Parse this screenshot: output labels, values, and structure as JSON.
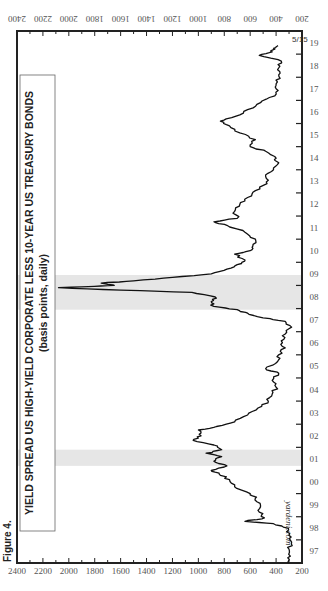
{
  "figure_label": "Figure 4.",
  "title_line1": "YIELD SPREAD US HIGH-YIELD CORPORATE LESS 10-YEAR US TREASURY BONDS",
  "title_line2": "(basis points, daily)",
  "watermark": "yardeni.com",
  "end_annotation": "5/15",
  "colors": {
    "line": "#111111",
    "recession": "#e6e6e6",
    "axis": "#222222",
    "text": "#555555"
  },
  "chart_data": {
    "type": "line",
    "title": "YIELD SPREAD US HIGH-YIELD CORPORATE LESS 10-YEAR US TREASURY BONDS",
    "subtitle": "(basis points, daily)",
    "xlabel": "",
    "ylabel": "basis points",
    "orientation": "rotated 90 degrees counterclockwise",
    "xlim": [
      1997,
      2020
    ],
    "ylim": [
      200,
      2400
    ],
    "x_tick_labels": [
      "97",
      "98",
      "99",
      "00",
      "01",
      "02",
      "03",
      "04",
      "05",
      "06",
      "07",
      "08",
      "09",
      "10",
      "11",
      "12",
      "13",
      "14",
      "15",
      "16",
      "17",
      "18",
      "19",
      "20"
    ],
    "y_tick_labels": [
      "200",
      "400",
      "600",
      "800",
      "1000",
      "1200",
      "1400",
      "1600",
      "1800",
      "2000",
      "2200",
      "2400"
    ],
    "y_ticks_both_sides": true,
    "grid": false,
    "legend": null,
    "recession_shading": [
      {
        "start": 2001.2,
        "end": 2001.9
      },
      {
        "start": 2007.95,
        "end": 2009.45
      }
    ],
    "annotation": {
      "text": "5/15",
      "x": 2019.37,
      "y": 385
    },
    "series": [
      {
        "name": "HY corporate less 10-yr Treasury spread",
        "x": [
          1997.0,
          1997.3,
          1997.6,
          1997.9,
          1998.2,
          1998.5,
          1998.7,
          1998.8,
          1998.95,
          1999.2,
          1999.5,
          1999.8,
          2000.0,
          2000.3,
          2000.6,
          2000.85,
          2001.0,
          2001.2,
          2001.4,
          2001.6,
          2001.75,
          2001.9,
          2002.1,
          2002.3,
          2002.5,
          2002.75,
          2002.9,
          2003.1,
          2003.4,
          2003.7,
          2004.0,
          2004.3,
          2004.6,
          2004.9,
          2005.2,
          2005.4,
          2005.7,
          2006.0,
          2006.3,
          2006.6,
          2006.9,
          2007.2,
          2007.45,
          2007.6,
          2007.8,
          2007.95,
          2008.1,
          2008.3,
          2008.5,
          2008.7,
          2008.8,
          2008.9,
          2008.95,
          2009.0,
          2009.1,
          2009.2,
          2009.35,
          2009.5,
          2009.7,
          2009.9,
          2010.1,
          2010.35,
          2010.5,
          2010.7,
          2011.0,
          2011.3,
          2011.6,
          2011.75,
          2011.9,
          2012.2,
          2012.5,
          2012.8,
          2013.1,
          2013.4,
          2013.7,
          2014.0,
          2014.3,
          2014.5,
          2014.8,
          2015.0,
          2015.3,
          2015.6,
          2015.9,
          2016.1,
          2016.3,
          2016.6,
          2016.9,
          2017.2,
          2017.5,
          2017.8,
          2018.1,
          2018.4,
          2018.7,
          2018.95,
          2019.1,
          2019.25,
          2019.37
        ],
        "values": [
          310,
          290,
          300,
          280,
          300,
          305,
          420,
          640,
          490,
          530,
          520,
          560,
          600,
          720,
          760,
          840,
          900,
          780,
          880,
          820,
          940,
          820,
          880,
          1040,
          980,
          1000,
          860,
          720,
          620,
          540,
          460,
          430,
          400,
          430,
          380,
          480,
          390,
          380,
          330,
          360,
          330,
          280,
          330,
          500,
          620,
          700,
          880,
          900,
          870,
          1050,
          1600,
          2080,
          1850,
          1650,
          1750,
          1500,
          1200,
          900,
          780,
          700,
          640,
          720,
          600,
          580,
          560,
          640,
          780,
          880,
          700,
          720,
          680,
          620,
          560,
          470,
          480,
          420,
          380,
          400,
          480,
          600,
          560,
          680,
          760,
          830,
          720,
          620,
          520,
          410,
          400,
          390,
          380,
          380,
          360,
          530,
          430,
          420,
          385
        ]
      }
    ]
  },
  "axes": {
    "left_value_labels": [
      "2400",
      "2200",
      "2000",
      "1800",
      "1600",
      "1400",
      "1200",
      "1000",
      "800",
      "600",
      "400",
      "200"
    ],
    "right_value_labels": [
      "2400",
      "2200",
      "2000",
      "1800",
      "1600",
      "1400",
      "1200",
      "1000",
      "800",
      "600",
      "400",
      "200"
    ],
    "year_labels": [
      "97",
      "98",
      "99",
      "00",
      "01",
      "02",
      "03",
      "04",
      "05",
      "06",
      "07",
      "08",
      "09",
      "10",
      "11",
      "12",
      "13",
      "14",
      "15",
      "16",
      "17",
      "18",
      "19",
      "20"
    ]
  }
}
